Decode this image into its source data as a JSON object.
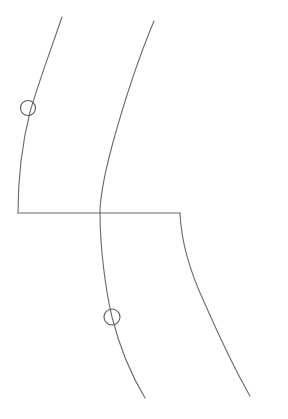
{
  "canvas": {
    "width": 288,
    "height": 419,
    "background_color": "#ffffff"
  },
  "style": {
    "line_color": "#6a6a6a",
    "line_width": 1.1,
    "marker_stroke_color": "#595959",
    "marker_stroke_width": 1.1
  },
  "diagram": {
    "elements": [
      {
        "name": "left-curve",
        "kind": "curve",
        "start": [
          62,
          17
        ],
        "end": [
          18,
          213
        ],
        "path": "M 62 17 C 50 52, 38 84, 30 112 C 23 140, 18 178, 18 213"
      },
      {
        "name": "middle-curve-upper",
        "kind": "curve",
        "start": [
          154,
          21
        ],
        "end": [
          100,
          213
        ],
        "path": "M 154 21 C 141 52, 124 102, 112 146 C 104 176, 100 197, 100 213"
      },
      {
        "name": "middle-curve-lower",
        "kind": "curve",
        "start": [
          100,
          213
        ],
        "end": [
          145,
          398
        ],
        "path": "M 100 213 C 100 245, 105 288, 112 317 C 120 349, 133 378, 145 398"
      },
      {
        "name": "horizontal-connector",
        "kind": "line",
        "start": [
          18,
          213
        ],
        "end": [
          180,
          213
        ],
        "path": "M 18 213 L 180 213"
      },
      {
        "name": "right-curve",
        "kind": "curve",
        "start": [
          180,
          213
        ],
        "end": [
          250,
          396
        ],
        "path": "M 180 213 C 181 240, 190 272, 205 304 C 220 338, 238 375, 250 396"
      }
    ],
    "markers": [
      {
        "name": "upper-circle-marker",
        "kind": "circle",
        "center": [
          28,
          108
        ],
        "radius": 7.5,
        "on_element": "left-curve"
      },
      {
        "name": "lower-circle-marker",
        "kind": "circle",
        "center": [
          112,
          317
        ],
        "radius": 8,
        "on_element": "middle-curve-lower"
      }
    ]
  }
}
